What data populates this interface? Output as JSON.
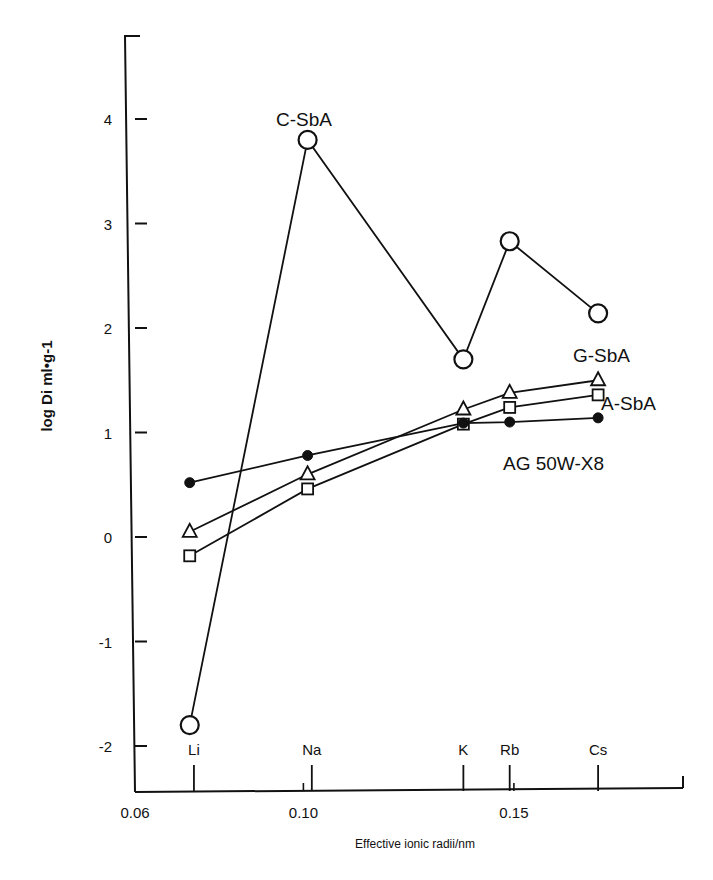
{
  "chart_data": {
    "type": "line",
    "title": "",
    "xlabel": "Effective ionic radii/nm",
    "ylabel": "log Di ml•g-1",
    "xlim": [
      0.06,
      0.19
    ],
    "ylim": [
      -2.44,
      4.8
    ],
    "grid": false,
    "x_ticks": [
      {
        "value": 0.06,
        "label": "0.06"
      },
      {
        "value": 0.1,
        "label": "0.10"
      },
      {
        "value": 0.15,
        "label": "0.15"
      }
    ],
    "y_ticks": [
      {
        "value": 4,
        "label": "4"
      },
      {
        "value": 3,
        "label": "3"
      },
      {
        "value": 2,
        "label": "2"
      },
      {
        "value": 1,
        "label": "1"
      },
      {
        "value": 0,
        "label": "0"
      },
      {
        "value": -1,
        "label": "-1"
      },
      {
        "value": -2,
        "label": "-2"
      }
    ],
    "categories": [
      "Li",
      "Na",
      "K",
      "Rb",
      "Cs"
    ],
    "x": [
      0.073,
      0.101,
      0.138,
      0.149,
      0.17
    ],
    "ion_ticks": [
      {
        "label": "Li",
        "value": 0.074
      },
      {
        "label": "Na",
        "value": 0.102
      },
      {
        "label": "K",
        "value": 0.138
      },
      {
        "label": "Rb",
        "value": 0.149
      },
      {
        "label": "Cs",
        "value": 0.17
      }
    ],
    "series": [
      {
        "name": "C-SbA",
        "marker": "open-circle-large",
        "values": [
          -1.8,
          3.8,
          1.7,
          2.83,
          2.14
        ]
      },
      {
        "name": "G-SbA",
        "marker": "open-triangle",
        "values": [
          0.05,
          0.6,
          1.22,
          1.38,
          1.5
        ]
      },
      {
        "name": "A-SbA",
        "marker": "open-square",
        "values": [
          -0.18,
          0.46,
          1.08,
          1.24,
          1.36
        ]
      },
      {
        "name": "AG 50W-X8",
        "marker": "filled-circle",
        "values": [
          0.52,
          0.78,
          1.09,
          1.1,
          1.14
        ]
      }
    ],
    "annotations": [
      {
        "text": "C-SbA",
        "near": "Na"
      },
      {
        "text": "G-SbA",
        "near": "Cs"
      },
      {
        "text": "A-SbA",
        "near": "Cs"
      },
      {
        "text": "AG 50W-X8",
        "near": "Rb"
      }
    ]
  }
}
